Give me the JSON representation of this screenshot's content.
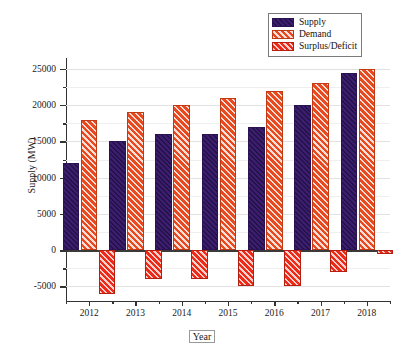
{
  "chart_data": {
    "type": "bar",
    "title": "",
    "xlabel": "Year",
    "ylabel": "Supply (MW)",
    "categories": [
      "2012",
      "2013",
      "2014",
      "2015",
      "2016",
      "2017",
      "2018"
    ],
    "series": [
      {
        "name": "Supply",
        "color": "#3b1e6e",
        "values": [
          12000,
          15000,
          16000,
          16000,
          17000,
          20000,
          24500
        ]
      },
      {
        "name": "Demand",
        "color": "#e8491f",
        "values": [
          18000,
          19000,
          20000,
          21000,
          22000,
          23000,
          25000
        ]
      },
      {
        "name": "Surplus/Deficit",
        "color": "#ee2b18",
        "values": [
          -6000,
          -4000,
          -4000,
          -5000,
          -5000,
          -3000,
          -500
        ]
      }
    ],
    "ylim": [
      -7000,
      26500
    ],
    "yticks": [
      25000,
      20000,
      15000,
      10000,
      5000,
      0,
      -5000
    ],
    "ytick_labels": [
      "25000",
      "20000",
      "15000",
      "10000",
      "5000",
      "0",
      "-5000"
    ],
    "grid": true,
    "legend_position": "top-right"
  },
  "legend": {
    "items": [
      {
        "label": "Supply"
      },
      {
        "label": "Demand"
      },
      {
        "label": "Surplus/Deficit"
      }
    ]
  }
}
